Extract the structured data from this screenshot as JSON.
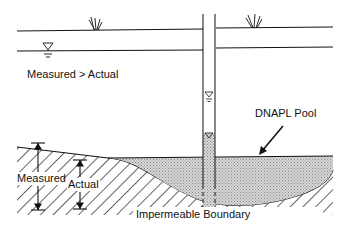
{
  "diagram": {
    "labels": {
      "measured_vs_actual": "Measured > Actual",
      "dnapl_pool": "DNAPL Pool",
      "measured": "Measured",
      "actual": "Actual",
      "impermeable_boundary": "Impermeable Boundary"
    },
    "colors": {
      "line": "#111111",
      "dnapl_fill": "#c8c8c8",
      "background": "#ffffff"
    },
    "icons": [
      "grass-icon",
      "grass-icon",
      "water-table-icon",
      "water-level-icon",
      "dnapl-level-icon"
    ]
  }
}
